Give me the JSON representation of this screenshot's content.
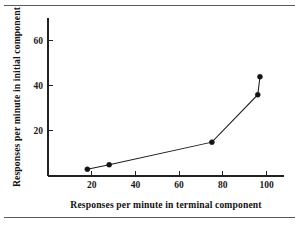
{
  "figure": {
    "name": "responses-per-minute-scatter",
    "background_color": "#ffffff",
    "ink_color": "#141414",
    "rules": {
      "top_label": "page-rule-top",
      "bottom_label": "page-rule-bottom"
    }
  },
  "chart_data": {
    "type": "line",
    "title": "",
    "xlabel": "Responses per minute in terminal component",
    "ylabel": "Responses per minute in initial component",
    "xlim": [
      0,
      108
    ],
    "ylim": [
      0,
      70
    ],
    "xticks": [
      20,
      40,
      60,
      80,
      100
    ],
    "xticklabels": [
      "20",
      "40",
      "60",
      "80",
      "100"
    ],
    "yticks": [
      20,
      40,
      60
    ],
    "yticklabels": [
      "20",
      "40",
      "60"
    ],
    "grid": false,
    "legend": false,
    "legend_position": "none",
    "marker": "filled-circle",
    "series": [
      {
        "name": "responses",
        "x": [
          18,
          28,
          75,
          96,
          97
        ],
        "y": [
          3,
          5,
          15,
          36,
          44
        ]
      }
    ],
    "points": [
      {
        "x": 18,
        "y": 3
      },
      {
        "x": 28,
        "y": 5
      },
      {
        "x": 75,
        "y": 15
      },
      {
        "x": 96,
        "y": 36
      },
      {
        "x": 97,
        "y": 44
      }
    ]
  }
}
